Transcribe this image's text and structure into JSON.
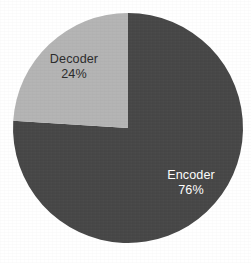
{
  "figure": {
    "background_color": "#ffffff",
    "width": 251,
    "height": 263
  },
  "geometry": {
    "center_x": 128,
    "center_y": 128,
    "radius": 115
  },
  "chart_data": {
    "type": "pie",
    "title": "",
    "subtitle": "",
    "xlabel": "",
    "ylabel": "",
    "grid": false,
    "legend_position": "none",
    "labels_inside_slices": true,
    "start_angle_deg": 90,
    "direction": "clockwise",
    "categories": [
      "Encoder",
      "Decoder"
    ],
    "values": [
      76,
      24
    ],
    "value_unit": "percent",
    "total": 100,
    "slices": [
      {
        "name": "Encoder",
        "value": 76,
        "value_text": "76%",
        "color": "#474747",
        "label_color": "#ffffff",
        "sweep_deg": 273.6,
        "start_deg": 90,
        "end_deg": -183.6
      },
      {
        "name": "Decoder",
        "value": 24,
        "value_text": "24%",
        "color": "#b4b4b4",
        "label_color": "#2b2b2b",
        "sweep_deg": 86.4,
        "start_deg": 90,
        "end_deg": 176.4
      }
    ],
    "annotations": []
  },
  "labels": {
    "decoder": {
      "name": "Decoder",
      "value_text": "24%"
    },
    "encoder": {
      "name": "Encoder",
      "value_text": "76%"
    }
  },
  "colors": {
    "encoder_slice": "#474747",
    "decoder_slice": "#b4b4b4",
    "background": "#ffffff",
    "dark_text": "#2b2b2b",
    "light_text": "#ffffff"
  }
}
